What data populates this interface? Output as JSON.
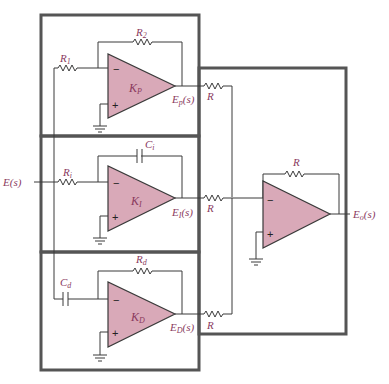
{
  "diagram": {
    "colors": {
      "opamp_fill": "#d9a9b8",
      "label": "#8a3a5e",
      "wire": "#3a3a3a",
      "box": "#555555"
    },
    "input": {
      "label": "E(s)"
    },
    "output": {
      "label": "Eo(s)",
      "main": "E",
      "sub": "o"
    },
    "stages": [
      {
        "id": "proportional",
        "gain": {
          "main": "K",
          "sub": "P"
        },
        "input_component": {
          "main": "R",
          "sub": "1"
        },
        "feedback_component": {
          "main": "R",
          "sub": "2"
        },
        "output": {
          "main": "E",
          "sub": "p",
          "suffix": "(s)"
        },
        "summing_resistor": "R"
      },
      {
        "id": "integral",
        "gain": {
          "main": "K",
          "sub": "I"
        },
        "input_component": {
          "main": "R",
          "sub": "i"
        },
        "feedback_component": {
          "main": "C",
          "sub": "i"
        },
        "output": {
          "main": "E",
          "sub": "I",
          "suffix": "(s)"
        },
        "summing_resistor": "R"
      },
      {
        "id": "derivative",
        "gain": {
          "main": "K",
          "sub": "D"
        },
        "input_component": {
          "main": "C",
          "sub": "d"
        },
        "feedback_component": {
          "main": "R",
          "sub": "d"
        },
        "output": {
          "main": "E",
          "sub": "D",
          "suffix": "(s)"
        },
        "summing_resistor": "R"
      }
    ],
    "summer": {
      "feedback_resistor": "R",
      "minus": "−",
      "plus": "+"
    },
    "signs": {
      "minus": "−",
      "plus": "+"
    },
    "input_label": {
      "main": "E",
      "suffix": "(s)"
    }
  }
}
